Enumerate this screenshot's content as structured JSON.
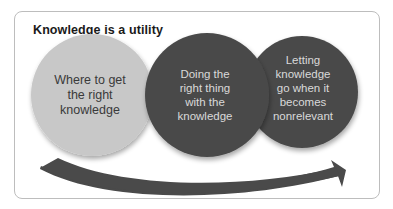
{
  "diagram": {
    "title": "Knowledge is a utility",
    "steps": [
      {
        "label": "Where to get the right knowledge",
        "lines": [
          "Where to get",
          "the right",
          "knowledge"
        ],
        "fill": "#c8c8c8",
        "text_color": "#3a3a3a"
      },
      {
        "label": "Doing the right thing with the knowledge",
        "lines": [
          "Doing the",
          "right thing",
          "with the",
          "knowledge"
        ],
        "fill": "#4a4a4a",
        "text_color": "#d9d9d9"
      },
      {
        "label": "Letting knowledge go when it becomes nonrelevant",
        "lines": [
          "Letting",
          "knowledge",
          "go when it",
          "becomes",
          "nonrelevant"
        ],
        "fill": "#4a4a4a",
        "text_color": "#d9d9d9"
      }
    ],
    "arrow": {
      "direction": "left-to-right",
      "color": "#4a4a4a"
    }
  }
}
